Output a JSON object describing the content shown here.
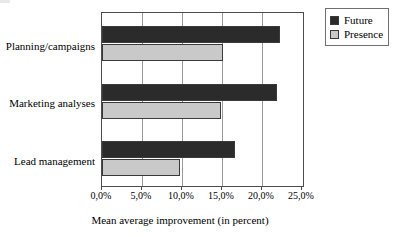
{
  "chart_data": {
    "type": "bar",
    "orientation": "horizontal",
    "title": "",
    "xlabel": "Mean average improvement (in percent)",
    "ylabel": "",
    "categories": [
      "Planning/campaigns",
      "Marketing analyses",
      "Lead management"
    ],
    "series": [
      {
        "name": "Future",
        "color": "#2b2b2b",
        "values": [
          22.1,
          21.8,
          16.6
        ]
      },
      {
        "name": "Presence",
        "color": "#c9c9c9",
        "values": [
          15.0,
          14.8,
          9.7
        ]
      }
    ],
    "xlim": [
      0,
      25
    ],
    "xticks": [
      0,
      5,
      10,
      15,
      20,
      25
    ],
    "xticklabels": [
      "0,0%",
      "5,0%",
      "10,0%",
      "15,0%",
      "20,0%",
      "25,0%"
    ],
    "grid": "vertical",
    "legend_position": "top-right",
    "legend_entries": [
      "Future",
      "Presence"
    ]
  },
  "axis": {
    "title": "Mean average improvement (in percent)",
    "ticks": [
      {
        "label": "0,0%",
        "value": 0
      },
      {
        "label": "5,0%",
        "value": 5
      },
      {
        "label": "10,0%",
        "value": 10
      },
      {
        "label": "15,0%",
        "value": 15
      },
      {
        "label": "20,0%",
        "value": 20
      },
      {
        "label": "25,0%",
        "value": 25
      }
    ]
  },
  "categories": [
    {
      "label": "Planning/campaigns",
      "future": 22.1,
      "presence": 15.0
    },
    {
      "label": "Marketing analyses",
      "future": 21.8,
      "presence": 14.8
    },
    {
      "label": "Lead management",
      "future": 16.6,
      "presence": 9.7
    }
  ],
  "legend": {
    "items": [
      {
        "label": "Future",
        "color": "#2b2b2b"
      },
      {
        "label": "Presence",
        "color": "#c9c9c9"
      }
    ]
  }
}
